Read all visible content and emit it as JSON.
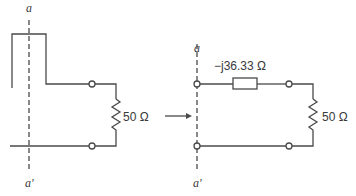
{
  "diagram": {
    "left_circuit": {
      "cut_top_label": "a",
      "cut_bottom_label": "a′",
      "load_label": "50 Ω"
    },
    "arrow": "transforms-to",
    "right_circuit": {
      "cut_top_label": "a",
      "cut_bottom_label": "a′",
      "series_impedance_label": "−j36.33 Ω",
      "load_label": "50 Ω"
    },
    "colors": {
      "line": "#4a4a4a",
      "text": "#3a3a3a",
      "background": "#ffffff"
    }
  }
}
